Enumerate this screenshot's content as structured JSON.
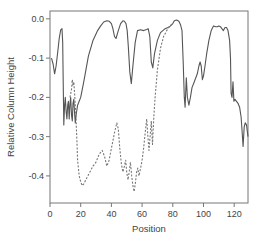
{
  "chart_data": {
    "type": "line",
    "title": "",
    "xlabel": "Position",
    "ylabel": "Relative Column Height",
    "xlim": [
      0,
      129
    ],
    "ylim": [
      -0.469,
      0.02
    ],
    "xticks": [
      0,
      20,
      40,
      60,
      80,
      100,
      120
    ],
    "xtick_labels": [
      "0",
      "20",
      "40",
      "60",
      "80",
      "100",
      "120"
    ],
    "yticks": [
      0.0,
      -0.1,
      -0.2,
      -0.3,
      -0.4
    ],
    "ytick_labels": [
      "0.0",
      "-0.1",
      "-0.2",
      "-0.3",
      "-0.4"
    ],
    "grid": false,
    "legend": null,
    "series": [
      {
        "name": "solid",
        "style": "solid",
        "color": "#555555",
        "x": [
          1,
          2,
          3,
          4,
          5,
          6,
          7,
          7.8,
          8.3,
          8.6,
          9,
          9.5,
          10,
          10.5,
          11,
          11.5,
          12,
          12.5,
          13,
          13.5,
          14,
          14.5,
          15,
          15.5,
          16,
          16.5,
          17,
          18,
          20,
          22,
          25,
          28,
          31,
          33,
          35,
          37,
          38.5,
          40,
          41,
          42,
          43,
          44.5,
          46,
          47.5,
          48.5,
          49.5,
          50.3,
          51,
          52,
          53,
          54,
          55.5,
          57,
          59,
          61,
          63,
          64,
          65,
          66,
          67,
          68,
          70,
          72,
          75,
          78,
          80,
          81,
          82.5,
          84,
          85,
          86,
          86.8,
          87.5,
          88,
          88.8,
          89.5,
          90.5,
          91.5,
          92.5,
          94,
          96,
          97,
          97.8,
          98.5,
          99.3,
          100,
          101,
          102,
          103.5,
          105,
          106.5,
          108,
          109,
          110,
          111,
          112,
          113,
          114,
          115,
          116,
          117,
          117.6,
          118,
          118.6,
          119.2,
          119.8,
          120.5,
          121.5,
          122.5,
          123.5,
          124.5,
          125.2,
          125.8,
          126.5,
          127.2,
          128,
          129
        ],
        "y": [
          -0.1,
          -0.115,
          -0.14,
          -0.12,
          -0.085,
          -0.05,
          -0.028,
          -0.025,
          -0.06,
          -0.16,
          -0.27,
          -0.22,
          -0.2,
          -0.235,
          -0.255,
          -0.22,
          -0.21,
          -0.255,
          -0.215,
          -0.2,
          -0.245,
          -0.26,
          -0.215,
          -0.205,
          -0.24,
          -0.265,
          -0.245,
          -0.22,
          -0.2,
          -0.16,
          -0.095,
          -0.055,
          -0.03,
          -0.018,
          -0.008,
          -0.005,
          -0.006,
          -0.012,
          -0.025,
          -0.045,
          -0.05,
          -0.03,
          -0.012,
          -0.005,
          -0.006,
          -0.012,
          -0.03,
          -0.07,
          -0.135,
          -0.165,
          -0.12,
          -0.06,
          -0.03,
          -0.028,
          -0.03,
          -0.027,
          -0.025,
          -0.045,
          -0.11,
          -0.125,
          -0.09,
          -0.055,
          -0.035,
          -0.025,
          -0.02,
          -0.012,
          -0.005,
          -0.003,
          -0.006,
          -0.015,
          -0.03,
          -0.11,
          -0.2,
          -0.225,
          -0.15,
          -0.2,
          -0.22,
          -0.2,
          -0.175,
          -0.16,
          -0.14,
          -0.12,
          -0.11,
          -0.12,
          -0.155,
          -0.145,
          -0.12,
          -0.09,
          -0.055,
          -0.03,
          -0.018,
          -0.02,
          -0.02,
          -0.018,
          -0.02,
          -0.025,
          -0.03,
          -0.022,
          -0.022,
          -0.03,
          -0.055,
          -0.1,
          -0.19,
          -0.2,
          -0.16,
          -0.21,
          -0.205,
          -0.21,
          -0.215,
          -0.225,
          -0.25,
          -0.29,
          -0.325,
          -0.275,
          -0.265,
          -0.27,
          -0.3
        ]
      },
      {
        "name": "dashed",
        "style": "dashed",
        "color": "#777777",
        "x": [
          13,
          14,
          14.5,
          15,
          15.5,
          16,
          16.5,
          17,
          17.5,
          18,
          19,
          20,
          21,
          22,
          24,
          26,
          28,
          30,
          32,
          34,
          35.5,
          37,
          38.5,
          40,
          42,
          43.5,
          44.5,
          45.5,
          46.5,
          47.5,
          48.5,
          49.3,
          50,
          50.8,
          51.6,
          52.4,
          53.2,
          54,
          54.8,
          55.6,
          56.4,
          57.2,
          58,
          59,
          60,
          61,
          62,
          63,
          63.8,
          64.5,
          65.2,
          66,
          66.8,
          67.6,
          68.5,
          70,
          72,
          74,
          76,
          78,
          80
        ],
        "y": [
          -0.2,
          -0.18,
          -0.155,
          -0.17,
          -0.16,
          -0.19,
          -0.22,
          -0.26,
          -0.31,
          -0.36,
          -0.4,
          -0.415,
          -0.425,
          -0.42,
          -0.405,
          -0.39,
          -0.375,
          -0.365,
          -0.345,
          -0.335,
          -0.35,
          -0.375,
          -0.36,
          -0.33,
          -0.29,
          -0.265,
          -0.28,
          -0.33,
          -0.37,
          -0.39,
          -0.375,
          -0.36,
          -0.39,
          -0.41,
          -0.39,
          -0.365,
          -0.4,
          -0.425,
          -0.44,
          -0.42,
          -0.39,
          -0.38,
          -0.4,
          -0.38,
          -0.36,
          -0.33,
          -0.29,
          -0.255,
          -0.3,
          -0.335,
          -0.3,
          -0.26,
          -0.32,
          -0.25,
          -0.2,
          -0.13,
          -0.075,
          -0.045,
          -0.03,
          -0.018,
          -0.012
        ]
      }
    ]
  }
}
